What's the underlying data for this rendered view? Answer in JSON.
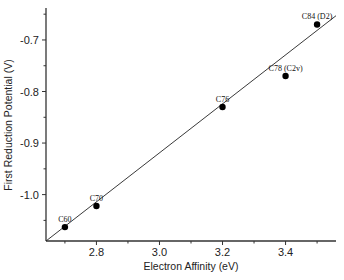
{
  "chart_data": {
    "type": "scatter",
    "title": "",
    "xlabel": "Electron Affinity (eV)",
    "ylabel": "First Reduction Potential (V)",
    "xlim": [
      2.64,
      3.56
    ],
    "ylim": [
      -1.09,
      -0.638
    ],
    "xticks": [
      2.8,
      3.0,
      3.2,
      3.4
    ],
    "xtick_labels": [
      "2.8",
      "3.0",
      "3.2",
      "3.4"
    ],
    "xminor_ticks": [
      2.7,
      2.9,
      3.1,
      3.3,
      3.5
    ],
    "yticks": [
      -0.7,
      -0.8,
      -0.9,
      -1.0
    ],
    "ytick_labels": [
      "-0.7",
      "-0.8",
      "-0.9",
      "-1.0"
    ],
    "yminor_ticks": [
      -0.65,
      -0.75,
      -0.85,
      -0.95,
      -1.05
    ],
    "grid": false,
    "legend": null,
    "points": [
      {
        "label": "C60",
        "x": 2.7,
        "y": -1.063
      },
      {
        "label": "C70",
        "x": 2.8,
        "y": -1.022
      },
      {
        "label": "C76",
        "x": 3.2,
        "y": -0.83
      },
      {
        "label": "C78 (C2v)",
        "x": 3.4,
        "y": -0.77
      },
      {
        "label": "C84 (D2)",
        "x": 3.5,
        "y": -0.67
      }
    ],
    "fit_line": {
      "x": [
        2.64,
        3.56
      ],
      "y": [
        -1.09,
        -0.653
      ]
    }
  }
}
